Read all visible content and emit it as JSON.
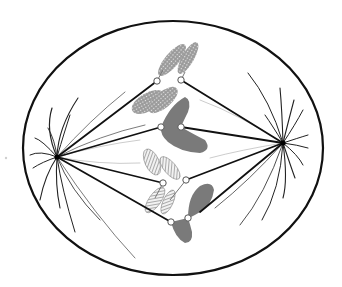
{
  "diagram": {
    "subject": "cell in metaphase of meiosis/mitosis with spindle apparatus",
    "colors": {
      "background": "#ffffff",
      "membrane": "#111111",
      "spindle": "#111111",
      "astral_ray": "#222222",
      "chromosome_dark": "#7a7a7a",
      "chromosome_stipple": "#8a8a8a",
      "chromosome_hatched": "#9a9a9a",
      "centromere_fill": "#ffffff",
      "centromere_stroke": "#555555"
    },
    "cell": {
      "cx": 173,
      "cy": 148,
      "rx": 150,
      "ry": 127
    },
    "poles": [
      {
        "name": "left-pole",
        "x": 57,
        "y": 157
      },
      {
        "name": "right-pole",
        "x": 283,
        "y": 143
      }
    ],
    "centromeres": [
      {
        "x": 157,
        "y": 81
      },
      {
        "x": 181,
        "y": 80
      },
      {
        "x": 161,
        "y": 127
      },
      {
        "x": 181,
        "y": 127
      },
      {
        "x": 163,
        "y": 183
      },
      {
        "x": 186,
        "y": 180
      },
      {
        "x": 171,
        "y": 222
      },
      {
        "x": 188,
        "y": 218
      }
    ],
    "chromosomes": [
      {
        "label": "stippled-chromosome-upper",
        "pattern": "stipple"
      },
      {
        "label": "stippled-chromosome-lower",
        "pattern": "stipple"
      },
      {
        "label": "dark-chromosome-upper",
        "pattern": "solid"
      },
      {
        "label": "hatched-chromosome",
        "pattern": "hatched"
      },
      {
        "label": "dark-chromosome-lower",
        "pattern": "solid"
      }
    ],
    "stray_mark": {
      "x": 6,
      "y": 158
    }
  }
}
